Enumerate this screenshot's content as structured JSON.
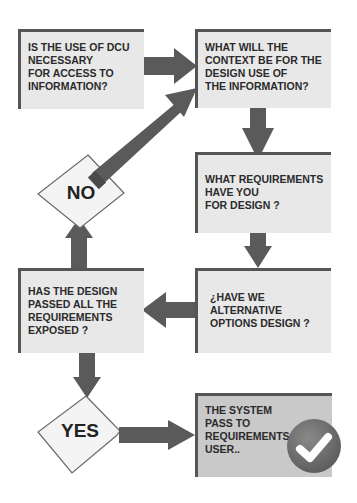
{
  "diagram": {
    "type": "flowchart",
    "colors": {
      "box_fill": "#e8e8e8",
      "box_fill_final": "#c9c9c9",
      "box_border": "#555555",
      "arrow": "#5a5a5a",
      "text": "#2b2b2b",
      "check_circle": "#6e6e6e",
      "check_mark": "#ffffff"
    },
    "nodes": [
      {
        "id": "dcu-necessary",
        "shape": "rectangle",
        "text": "IS THE USE OF DCU\n NECESSARY\n FOR ACCESS TO\nINFORMATION?"
      },
      {
        "id": "context",
        "shape": "rectangle",
        "text": "WHAT WILL THE\nCONTEXT BE FOR THE\nDESIGN USE OF\nTHE INFORMATION?"
      },
      {
        "id": "requirements",
        "shape": "rectangle",
        "text": "WHAT REQUIREMENTS\nHAVE YOU\nFOR DESIGN ?"
      },
      {
        "id": "alternatives",
        "shape": "rectangle",
        "text": "¿HAVE WE\nALTERNATIVE\nOPTIONS DESIGN ?"
      },
      {
        "id": "passed",
        "shape": "rectangle",
        "text": "HAS THE DESIGN\nPASSED ALL THE\nREQUIREMENTS\nEXPOSED ?"
      },
      {
        "id": "no",
        "shape": "diamond",
        "text": "NO"
      },
      {
        "id": "yes",
        "shape": "diamond",
        "text": "YES"
      },
      {
        "id": "system-pass",
        "shape": "rectangle",
        "text": "THE SYSTEM\nPASS TO\nREQUIREMENTS\nUSER.."
      }
    ],
    "edges": [
      {
        "from": "dcu-necessary",
        "to": "context"
      },
      {
        "from": "context",
        "to": "requirements"
      },
      {
        "from": "requirements",
        "to": "alternatives"
      },
      {
        "from": "alternatives",
        "to": "passed"
      },
      {
        "from": "passed",
        "to": "no"
      },
      {
        "from": "no",
        "to": "context"
      },
      {
        "from": "passed",
        "to": "yes"
      },
      {
        "from": "yes",
        "to": "system-pass"
      }
    ],
    "icons": {
      "final": "checkmark-badge-icon"
    }
  }
}
